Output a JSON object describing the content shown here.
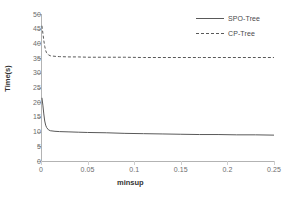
{
  "chart_data": {
    "type": "line",
    "title": "",
    "xlabel": "minsup",
    "ylabel": "Time(s)",
    "xlim": [
      0,
      0.25
    ],
    "ylim": [
      0,
      50
    ],
    "xticks": [
      "0",
      "0.05",
      "0.1",
      "0.15",
      "0.2",
      "0.25"
    ],
    "xtick_values": [
      0,
      0.05,
      0.1,
      0.15,
      0.2,
      0.25
    ],
    "yticks": [
      "0",
      "5",
      "10",
      "15",
      "20",
      "25",
      "30",
      "35",
      "40",
      "45",
      "50"
    ],
    "ytick_values": [
      0,
      5,
      10,
      15,
      20,
      25,
      30,
      35,
      40,
      45,
      50
    ],
    "grid": false,
    "legend_position": "top-right",
    "series": [
      {
        "name": "SPO-Tree",
        "style": "solid",
        "color": "#595959",
        "x": [
          0.001,
          0.002,
          0.003,
          0.004,
          0.005,
          0.006,
          0.008,
          0.01,
          0.015,
          0.02,
          0.03,
          0.04,
          0.05,
          0.07,
          0.09,
          0.11,
          0.13,
          0.15,
          0.17,
          0.19,
          0.21,
          0.23,
          0.25
        ],
        "y": [
          21.5,
          19.0,
          16.0,
          13.6,
          12.2,
          11.4,
          10.6,
          10.3,
          10.1,
          10.0,
          9.9,
          9.8,
          9.7,
          9.6,
          9.4,
          9.3,
          9.2,
          9.1,
          9.0,
          9.0,
          8.9,
          8.9,
          8.8
        ]
      },
      {
        "name": "CP-Tree",
        "style": "dashed",
        "color": "#595959",
        "x": [
          0.001,
          0.002,
          0.003,
          0.004,
          0.005,
          0.006,
          0.008,
          0.01,
          0.015,
          0.02,
          0.03,
          0.04,
          0.05,
          0.07,
          0.09,
          0.11,
          0.13,
          0.15,
          0.17,
          0.19,
          0.21,
          0.23,
          0.25
        ],
        "y": [
          46.0,
          43.5,
          41.0,
          39.0,
          37.6,
          36.8,
          36.1,
          35.8,
          35.6,
          35.5,
          35.4,
          35.4,
          35.3,
          35.3,
          35.3,
          35.2,
          35.2,
          35.2,
          35.2,
          35.2,
          35.2,
          35.2,
          35.2
        ]
      }
    ]
  },
  "legend": {
    "items": [
      {
        "label": "SPO-Tree",
        "style": "solid"
      },
      {
        "label": "CP-Tree",
        "style": "dashed"
      }
    ]
  }
}
